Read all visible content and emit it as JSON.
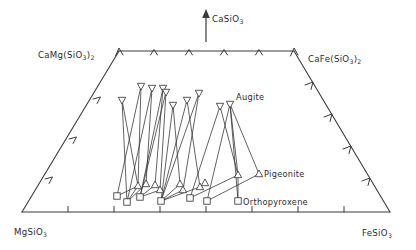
{
  "figure": {
    "type": "ternary-quadrilateral-scatter",
    "title": "",
    "apex_arrow_label": "CaSiO3",
    "corner_labels": {
      "top_left": "CaMg(SiO3)2",
      "top_right": "CaFe(SiO3)2",
      "bottom_left": "MgSiO3",
      "bottom_right": "FeSiO3"
    },
    "phase_labels": {
      "augite": "Augite",
      "pigeonite": "Pigeonite",
      "orthopyroxene": "Orthopyroxene"
    },
    "marker_legend": [
      {
        "name": "augite",
        "glyph": "down-triangle",
        "label": "Augite"
      },
      {
        "name": "pigeonite",
        "glyph": "up-triangle",
        "label": "Pigeonite"
      },
      {
        "name": "orthopyroxene",
        "glyph": "square",
        "label": "Orthopyroxene"
      }
    ],
    "colors": {
      "ink": "#2b2b2b",
      "axis": "#3a3a3a",
      "marker_fill": "#ffffff",
      "background": "#ffffff"
    },
    "axis_ticks": {
      "top_count": 4,
      "bottom_count": 8,
      "left_count": 3,
      "right_count": 4
    }
  },
  "chart_data": {
    "type": "scatter",
    "title": "",
    "xlabel": "",
    "ylabel": "",
    "grid": false,
    "legend_position": "inline-annotations",
    "quad_vertices": {
      "CaMg(SiO3)2": [
        119,
        51
      ],
      "CaFe(SiO3)2": [
        294,
        51
      ],
      "FeSiO3": [
        390,
        212
      ],
      "MgSiO3": [
        22,
        212
      ]
    },
    "series": [
      {
        "name": "Augite",
        "glyph": "down-triangle",
        "points": [
          [
            141,
            86
          ],
          [
            122,
            100
          ],
          [
            152,
            88
          ],
          [
            163,
            88
          ],
          [
            166,
            92
          ],
          [
            199,
            93
          ],
          [
            173,
            105
          ],
          [
            187,
            100
          ],
          [
            220,
            106
          ],
          [
            230,
            104
          ]
        ]
      },
      {
        "name": "Pigeonite",
        "glyph": "up-triangle",
        "points": [
          [
            138,
            186
          ],
          [
            146,
            184
          ],
          [
            155,
            185
          ],
          [
            160,
            190
          ],
          [
            183,
            190
          ],
          [
            180,
            184
          ],
          [
            200,
            187
          ],
          [
            205,
            183
          ],
          [
            238,
            175
          ],
          [
            259,
            174
          ]
        ]
      },
      {
        "name": "Orthopyroxene",
        "glyph": "square",
        "points": [
          [
            117,
            196
          ],
          [
            127,
            202
          ],
          [
            140,
            197
          ],
          [
            161,
            201
          ],
          [
            190,
            198
          ],
          [
            207,
            201
          ],
          [
            238,
            201
          ]
        ]
      }
    ],
    "tie_line_groups": [
      {
        "augite": [
          141,
          86
        ],
        "pigeonite": [
          138,
          186
        ],
        "opx": [
          117,
          196
        ]
      },
      {
        "augite": [
          122,
          100
        ],
        "pigeonite": [
          138,
          186
        ],
        "opx": [
          127,
          202
        ]
      },
      {
        "augite": [
          152,
          88
        ],
        "pigeonite": [
          146,
          184
        ],
        "opx": [
          127,
          202
        ]
      },
      {
        "augite": [
          163,
          88
        ],
        "pigeonite": [
          155,
          185
        ],
        "opx": [
          140,
          197
        ]
      },
      {
        "augite": [
          166,
          92
        ],
        "pigeonite": [
          160,
          190
        ],
        "opx": [
          140,
          197
        ]
      },
      {
        "augite": [
          199,
          93
        ],
        "pigeonite": [
          183,
          190
        ],
        "opx": [
          161,
          201
        ]
      },
      {
        "augite": [
          173,
          105
        ],
        "pigeonite": [
          180,
          184
        ],
        "opx": [
          161,
          201
        ]
      },
      {
        "augite": [
          187,
          100
        ],
        "pigeonite": [
          200,
          187
        ],
        "opx": [
          161,
          201
        ]
      },
      {
        "augite": [
          220,
          106
        ],
        "pigeonite": [
          238,
          175
        ],
        "opx": [
          190,
          198
        ]
      },
      {
        "augite": [
          230,
          104
        ],
        "pigeonite": [
          259,
          174
        ],
        "opx": [
          207,
          201
        ]
      },
      {
        "augite": [
          230,
          104
        ],
        "pigeonite": [
          238,
          175
        ],
        "opx": [
          238,
          201
        ]
      }
    ]
  }
}
